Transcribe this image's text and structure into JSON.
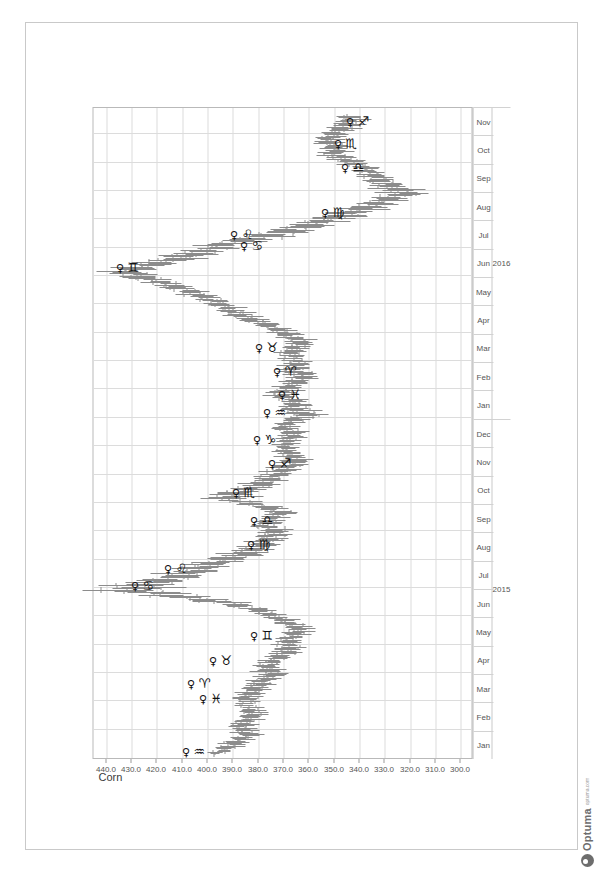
{
  "app": {
    "brand_name": "Optuma",
    "brand_url": "optuma.com",
    "brand_color": "#6d6d6d"
  },
  "chart_data": {
    "type": "line",
    "render_style": "ohlc-bars",
    "title": "Corn",
    "xlabel": "",
    "ylabel": "",
    "ylim": [
      295,
      445
    ],
    "yticks": [
      "440.0",
      "430.0",
      "420.0",
      "410.0",
      "400.0",
      "390.0",
      "380.0",
      "370.0",
      "360.0",
      "350.0",
      "340.0",
      "330.0",
      "320.0",
      "310.0",
      "300.0"
    ],
    "ytick_values": [
      440,
      430,
      420,
      410,
      400,
      390,
      380,
      370,
      360,
      350,
      340,
      330,
      320,
      310,
      300
    ],
    "grid": true,
    "legend": "none",
    "rotation_deg": 90,
    "x_months": [
      "Jan",
      "Feb",
      "Mar",
      "Apr",
      "May",
      "Jun",
      "Jul",
      "Aug",
      "Sep",
      "Oct",
      "Nov",
      "Dec",
      "Jan",
      "Feb",
      "Mar",
      "Apr",
      "May",
      "Jun",
      "Jul",
      "Aug",
      "Sep",
      "Oct",
      "Nov"
    ],
    "x_years": [
      {
        "label": "2015",
        "span": 12
      },
      {
        "label": "2016",
        "span": 11
      }
    ],
    "xlim_start": "2015-01",
    "xlim_end": "2016-11",
    "series": [
      {
        "name": "Corn",
        "ohlc": [
          {
            "t": "2015-01-05",
            "o": 398,
            "h": 401,
            "l": 395,
            "c": 397
          },
          {
            "t": "2015-01-12",
            "o": 397,
            "h": 399,
            "l": 389,
            "c": 391
          },
          {
            "t": "2015-01-19",
            "o": 391,
            "h": 395,
            "l": 386,
            "c": 388
          },
          {
            "t": "2015-01-26",
            "o": 388,
            "h": 392,
            "l": 382,
            "c": 384
          },
          {
            "t": "2015-02-02",
            "o": 384,
            "h": 390,
            "l": 380,
            "c": 387
          },
          {
            "t": "2015-02-09",
            "o": 387,
            "h": 392,
            "l": 383,
            "c": 385
          },
          {
            "t": "2015-02-16",
            "o": 385,
            "h": 389,
            "l": 379,
            "c": 381
          },
          {
            "t": "2015-02-23",
            "o": 381,
            "h": 386,
            "l": 377,
            "c": 383
          },
          {
            "t": "2015-03-02",
            "o": 383,
            "h": 390,
            "l": 380,
            "c": 386
          },
          {
            "t": "2015-03-09",
            "o": 386,
            "h": 391,
            "l": 381,
            "c": 383
          },
          {
            "t": "2015-03-16",
            "o": 383,
            "h": 388,
            "l": 378,
            "c": 380
          },
          {
            "t": "2015-03-23",
            "o": 380,
            "h": 385,
            "l": 375,
            "c": 378
          },
          {
            "t": "2015-03-30",
            "o": 378,
            "h": 384,
            "l": 372,
            "c": 374
          },
          {
            "t": "2015-04-06",
            "o": 374,
            "h": 380,
            "l": 371,
            "c": 377
          },
          {
            "t": "2015-04-13",
            "o": 377,
            "h": 382,
            "l": 373,
            "c": 375
          },
          {
            "t": "2015-04-20",
            "o": 375,
            "h": 379,
            "l": 368,
            "c": 370
          },
          {
            "t": "2015-04-27",
            "o": 370,
            "h": 375,
            "l": 365,
            "c": 367
          },
          {
            "t": "2015-05-04",
            "o": 367,
            "h": 372,
            "l": 363,
            "c": 369
          },
          {
            "t": "2015-05-11",
            "o": 369,
            "h": 374,
            "l": 364,
            "c": 366
          },
          {
            "t": "2015-05-18",
            "o": 366,
            "h": 371,
            "l": 361,
            "c": 363
          },
          {
            "t": "2015-05-25",
            "o": 363,
            "h": 370,
            "l": 360,
            "c": 368
          },
          {
            "t": "2015-06-01",
            "o": 368,
            "h": 376,
            "l": 366,
            "c": 374
          },
          {
            "t": "2015-06-08",
            "o": 374,
            "h": 383,
            "l": 372,
            "c": 381
          },
          {
            "t": "2015-06-15",
            "o": 381,
            "h": 395,
            "l": 379,
            "c": 393
          },
          {
            "t": "2015-06-22",
            "o": 393,
            "h": 412,
            "l": 391,
            "c": 410
          },
          {
            "t": "2015-06-29",
            "o": 410,
            "h": 434,
            "l": 406,
            "c": 430
          },
          {
            "t": "2015-07-06",
            "o": 430,
            "h": 436,
            "l": 418,
            "c": 421
          },
          {
            "t": "2015-07-13",
            "o": 421,
            "h": 428,
            "l": 410,
            "c": 413
          },
          {
            "t": "2015-07-20",
            "o": 413,
            "h": 419,
            "l": 402,
            "c": 405
          },
          {
            "t": "2015-07-27",
            "o": 405,
            "h": 411,
            "l": 396,
            "c": 398
          },
          {
            "t": "2015-08-03",
            "o": 398,
            "h": 403,
            "l": 386,
            "c": 388
          },
          {
            "t": "2015-08-10",
            "o": 388,
            "h": 394,
            "l": 381,
            "c": 383
          },
          {
            "t": "2015-08-17",
            "o": 383,
            "h": 389,
            "l": 377,
            "c": 379
          },
          {
            "t": "2015-08-24",
            "o": 379,
            "h": 385,
            "l": 373,
            "c": 376
          },
          {
            "t": "2015-08-31",
            "o": 376,
            "h": 381,
            "l": 370,
            "c": 372
          },
          {
            "t": "2015-09-07",
            "o": 372,
            "h": 379,
            "l": 369,
            "c": 377
          },
          {
            "t": "2015-09-14",
            "o": 377,
            "h": 383,
            "l": 373,
            "c": 375
          },
          {
            "t": "2015-09-21",
            "o": 375,
            "h": 380,
            "l": 369,
            "c": 371
          },
          {
            "t": "2015-09-28",
            "o": 371,
            "h": 380,
            "l": 368,
            "c": 378
          },
          {
            "t": "2015-10-05",
            "o": 378,
            "h": 394,
            "l": 376,
            "c": 392
          },
          {
            "t": "2015-10-12",
            "o": 392,
            "h": 398,
            "l": 385,
            "c": 387
          },
          {
            "t": "2015-10-19",
            "o": 387,
            "h": 392,
            "l": 378,
            "c": 380
          },
          {
            "t": "2015-10-26",
            "o": 380,
            "h": 385,
            "l": 374,
            "c": 377
          },
          {
            "t": "2015-11-02",
            "o": 377,
            "h": 382,
            "l": 370,
            "c": 372
          },
          {
            "t": "2015-11-09",
            "o": 372,
            "h": 377,
            "l": 365,
            "c": 368
          },
          {
            "t": "2015-11-16",
            "o": 368,
            "h": 373,
            "l": 362,
            "c": 364
          },
          {
            "t": "2015-11-23",
            "o": 364,
            "h": 370,
            "l": 361,
            "c": 368
          },
          {
            "t": "2015-11-30",
            "o": 368,
            "h": 374,
            "l": 365,
            "c": 370
          },
          {
            "t": "2015-12-07",
            "o": 370,
            "h": 376,
            "l": 366,
            "c": 368
          },
          {
            "t": "2015-12-14",
            "o": 368,
            "h": 373,
            "l": 362,
            "c": 365
          },
          {
            "t": "2015-12-21",
            "o": 365,
            "h": 372,
            "l": 363,
            "c": 370
          },
          {
            "t": "2015-12-28",
            "o": 370,
            "h": 375,
            "l": 365,
            "c": 367
          },
          {
            "t": "2016-01-04",
            "o": 367,
            "h": 372,
            "l": 359,
            "c": 361
          },
          {
            "t": "2016-01-11",
            "o": 361,
            "h": 368,
            "l": 357,
            "c": 366
          },
          {
            "t": "2016-01-18",
            "o": 366,
            "h": 372,
            "l": 362,
            "c": 364
          },
          {
            "t": "2016-01-25",
            "o": 364,
            "h": 373,
            "l": 361,
            "c": 371
          },
          {
            "t": "2016-02-01",
            "o": 371,
            "h": 377,
            "l": 367,
            "c": 369
          },
          {
            "t": "2016-02-08",
            "o": 369,
            "h": 375,
            "l": 364,
            "c": 366
          },
          {
            "t": "2016-02-15",
            "o": 366,
            "h": 371,
            "l": 359,
            "c": 361
          },
          {
            "t": "2016-02-22",
            "o": 361,
            "h": 368,
            "l": 357,
            "c": 366
          },
          {
            "t": "2016-02-29",
            "o": 366,
            "h": 372,
            "l": 362,
            "c": 364
          },
          {
            "t": "2016-03-07",
            "o": 364,
            "h": 370,
            "l": 360,
            "c": 368
          },
          {
            "t": "2016-03-14",
            "o": 368,
            "h": 374,
            "l": 364,
            "c": 366
          },
          {
            "t": "2016-03-21",
            "o": 366,
            "h": 371,
            "l": 360,
            "c": 362
          },
          {
            "t": "2016-03-28",
            "o": 362,
            "h": 369,
            "l": 358,
            "c": 367
          },
          {
            "t": "2016-04-04",
            "o": 367,
            "h": 374,
            "l": 365,
            "c": 372
          },
          {
            "t": "2016-04-11",
            "o": 372,
            "h": 381,
            "l": 370,
            "c": 379
          },
          {
            "t": "2016-04-18",
            "o": 379,
            "h": 388,
            "l": 376,
            "c": 386
          },
          {
            "t": "2016-04-25",
            "o": 386,
            "h": 393,
            "l": 382,
            "c": 390
          },
          {
            "t": "2016-05-02",
            "o": 390,
            "h": 397,
            "l": 387,
            "c": 395
          },
          {
            "t": "2016-05-09",
            "o": 395,
            "h": 404,
            "l": 392,
            "c": 402
          },
          {
            "t": "2016-05-16",
            "o": 402,
            "h": 411,
            "l": 399,
            "c": 409
          },
          {
            "t": "2016-05-23",
            "o": 409,
            "h": 418,
            "l": 406,
            "c": 416
          },
          {
            "t": "2016-05-30",
            "o": 416,
            "h": 428,
            "l": 413,
            "c": 425
          },
          {
            "t": "2016-06-06",
            "o": 425,
            "h": 438,
            "l": 421,
            "c": 432
          },
          {
            "t": "2016-06-13",
            "o": 432,
            "h": 437,
            "l": 420,
            "c": 423
          },
          {
            "t": "2016-06-20",
            "o": 423,
            "h": 428,
            "l": 410,
            "c": 412
          },
          {
            "t": "2016-06-27",
            "o": 412,
            "h": 417,
            "l": 400,
            "c": 402
          },
          {
            "t": "2016-07-04",
            "o": 402,
            "h": 407,
            "l": 390,
            "c": 392
          },
          {
            "t": "2016-07-11",
            "o": 392,
            "h": 396,
            "l": 378,
            "c": 380
          },
          {
            "t": "2016-07-18",
            "o": 380,
            "h": 385,
            "l": 368,
            "c": 370
          },
          {
            "t": "2016-07-25",
            "o": 370,
            "h": 375,
            "l": 359,
            "c": 361
          },
          {
            "t": "2016-08-01",
            "o": 361,
            "h": 366,
            "l": 349,
            "c": 351
          },
          {
            "t": "2016-08-08",
            "o": 351,
            "h": 357,
            "l": 340,
            "c": 342
          },
          {
            "t": "2016-08-15",
            "o": 342,
            "h": 348,
            "l": 333,
            "c": 335
          },
          {
            "t": "2016-08-22",
            "o": 335,
            "h": 341,
            "l": 328,
            "c": 330
          },
          {
            "t": "2016-08-29",
            "o": 330,
            "h": 337,
            "l": 320,
            "c": 322
          },
          {
            "t": "2016-09-05",
            "o": 322,
            "h": 329,
            "l": 317,
            "c": 327
          },
          {
            "t": "2016-09-12",
            "o": 327,
            "h": 334,
            "l": 323,
            "c": 331
          },
          {
            "t": "2016-09-19",
            "o": 331,
            "h": 338,
            "l": 328,
            "c": 335
          },
          {
            "t": "2016-09-26",
            "o": 335,
            "h": 342,
            "l": 331,
            "c": 339
          },
          {
            "t": "2016-10-03",
            "o": 339,
            "h": 348,
            "l": 336,
            "c": 345
          },
          {
            "t": "2016-10-10",
            "o": 345,
            "h": 353,
            "l": 342,
            "c": 350
          },
          {
            "t": "2016-10-17",
            "o": 350,
            "h": 357,
            "l": 346,
            "c": 348
          },
          {
            "t": "2016-10-24",
            "o": 348,
            "h": 355,
            "l": 345,
            "c": 353
          },
          {
            "t": "2016-10-31",
            "o": 353,
            "h": 359,
            "l": 349,
            "c": 351
          },
          {
            "t": "2016-11-07",
            "o": 351,
            "h": 357,
            "l": 345,
            "c": 347
          },
          {
            "t": "2016-11-14",
            "o": 347,
            "h": 352,
            "l": 341,
            "c": 343
          }
        ]
      }
    ],
    "annotations": [
      {
        "planet": "♀",
        "sign": "♒",
        "sign_name": "Aquarius",
        "t": "2015-01-05",
        "value": 412
      },
      {
        "planet": "♀",
        "sign": "♓",
        "sign_name": "Pisces",
        "t": "2015-03-01",
        "value": 405
      },
      {
        "planet": "♀",
        "sign": "♈",
        "sign_name": "Aries",
        "t": "2015-03-18",
        "value": 410
      },
      {
        "planet": "♀",
        "sign": "♉",
        "sign_name": "Taurus",
        "t": "2015-04-12",
        "value": 401
      },
      {
        "planet": "♀",
        "sign": "♊",
        "sign_name": "Gemini",
        "t": "2015-05-08",
        "value": 385
      },
      {
        "planet": "♀",
        "sign": "♋",
        "sign_name": "Cancer",
        "t": "2015-07-01",
        "value": 432
      },
      {
        "planet": "♀",
        "sign": "♌",
        "sign_name": "Leo",
        "t": "2015-07-20",
        "value": 419
      },
      {
        "planet": "♀",
        "sign": "♍",
        "sign_name": "Virgo",
        "t": "2015-08-15",
        "value": 386
      },
      {
        "planet": "♀",
        "sign": "♎",
        "sign_name": "Libra",
        "t": "2015-09-10",
        "value": 385
      },
      {
        "planet": "♀",
        "sign": "♏",
        "sign_name": "Scorpio",
        "t": "2015-10-10",
        "value": 392
      },
      {
        "planet": "♀",
        "sign": "♐",
        "sign_name": "Sagittarius",
        "t": "2015-11-10",
        "value": 378
      },
      {
        "planet": "♀",
        "sign": "♑",
        "sign_name": "Capricorn",
        "t": "2015-12-06",
        "value": 384
      },
      {
        "planet": "♀",
        "sign": "♒",
        "sign_name": "Aquarius",
        "t": "2016-01-04",
        "value": 380
      },
      {
        "planet": "♀",
        "sign": "♓",
        "sign_name": "Pisces",
        "t": "2016-01-24",
        "value": 374
      },
      {
        "planet": "♀",
        "sign": "♈",
        "sign_name": "Aries",
        "t": "2016-02-18",
        "value": 376
      },
      {
        "planet": "♀",
        "sign": "♉",
        "sign_name": "Taurus",
        "t": "2016-03-13",
        "value": 383
      },
      {
        "planet": "♀",
        "sign": "♊",
        "sign_name": "Gemini",
        "t": "2016-06-08",
        "value": 438
      },
      {
        "planet": "♀",
        "sign": "♋",
        "sign_name": "Cancer",
        "t": "2016-07-01",
        "value": 389
      },
      {
        "planet": "♀",
        "sign": "♌",
        "sign_name": "Leo",
        "t": "2016-07-13",
        "value": 393
      },
      {
        "planet": "♀",
        "sign": "♍",
        "sign_name": "Virgo",
        "t": "2016-08-06",
        "value": 357
      },
      {
        "planet": "♀",
        "sign": "♎",
        "sign_name": "Libra",
        "t": "2016-09-24",
        "value": 349
      },
      {
        "planet": "♀",
        "sign": "♏",
        "sign_name": "Scorpio",
        "t": "2016-10-19",
        "value": 352
      },
      {
        "planet": "♀",
        "sign": "♐",
        "sign_name": "Sagittarius",
        "t": "2016-11-12",
        "value": 347
      }
    ]
  }
}
